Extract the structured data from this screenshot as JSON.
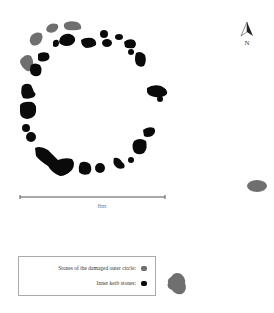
{
  "diagram": {
    "type": "archaeological site plan",
    "colors": {
      "outer_circle": "#6f6f6f",
      "inner_kerb": "#0a0a0a",
      "scale_line": "#555555",
      "north_arrow": "#222222"
    },
    "north_arrow": {
      "label": "N"
    },
    "scale_bar": {
      "label": "8m"
    },
    "legend": {
      "items": [
        {
          "label": "Stones of the damaged outer circle:",
          "color": "#6f6f6f"
        },
        {
          "label": "Inner kerb stones:",
          "color": "#0a0a0a"
        }
      ]
    }
  }
}
